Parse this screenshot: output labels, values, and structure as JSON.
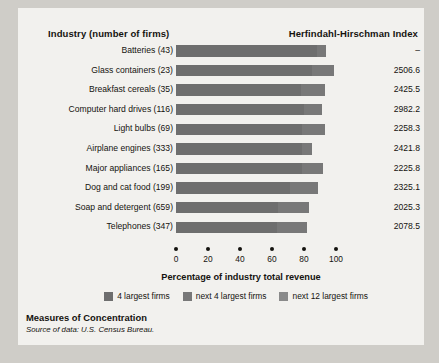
{
  "header": {
    "industry_label": "Industry (number of firms)",
    "hhi_label": "Herfindahl-Hirschman Index"
  },
  "caption": {
    "title": "Measures of Concentration",
    "source": "Source of data: U.S. Census Bureau."
  },
  "legend": {
    "position": "bottom-center",
    "items": [
      {
        "label": "4 largest firms",
        "color": "#6e6e6e"
      },
      {
        "label": "next 4 largest firms",
        "color": "#787878"
      },
      {
        "label": "next 12 largest firms",
        "color": "#8a8a8a"
      }
    ]
  },
  "chart_data": {
    "type": "bar",
    "orientation": "horizontal",
    "stacked": true,
    "title": "Measures of Concentration",
    "xlabel": "Percentage of industry total revenue",
    "ylabel": "Industry (number of firms)",
    "xlim": [
      0,
      100
    ],
    "xticks": [
      0,
      20,
      40,
      60,
      80,
      100
    ],
    "grid": false,
    "categories": [
      "Batteries  (43)",
      "Glass containers  (23)",
      "Breakfast cereals  (35)",
      "Computer hard drives  (116)",
      "Light bulbs  (69)",
      "Airplane engines  (333)",
      "Major appliances  (165)",
      "Dog and cat food  (199)",
      "Soap and detergent  (659)",
      "Telephones  (347)"
    ],
    "series": [
      {
        "name": "4 largest firms",
        "values": [
          88,
          85,
          78,
          80,
          79,
          79,
          79,
          71,
          64,
          63
        ]
      },
      {
        "name": "next 4 largest firms",
        "values": [
          6,
          14,
          15,
          11,
          14,
          6,
          13,
          18,
          19,
          19
        ]
      },
      {
        "name": "next 12 largest firms",
        "values": [
          0,
          0,
          0,
          0,
          0,
          0,
          0,
          0,
          0,
          0
        ]
      }
    ],
    "totals": [
      94,
      99,
      93,
      91,
      93,
      85,
      92,
      89,
      83,
      82
    ],
    "hhi_values": [
      "–",
      "2506.6",
      "2425.5",
      "2982.2",
      "2258.3",
      "2421.8",
      "2225.8",
      "2325.1",
      "2025.3",
      "2078.5"
    ]
  }
}
